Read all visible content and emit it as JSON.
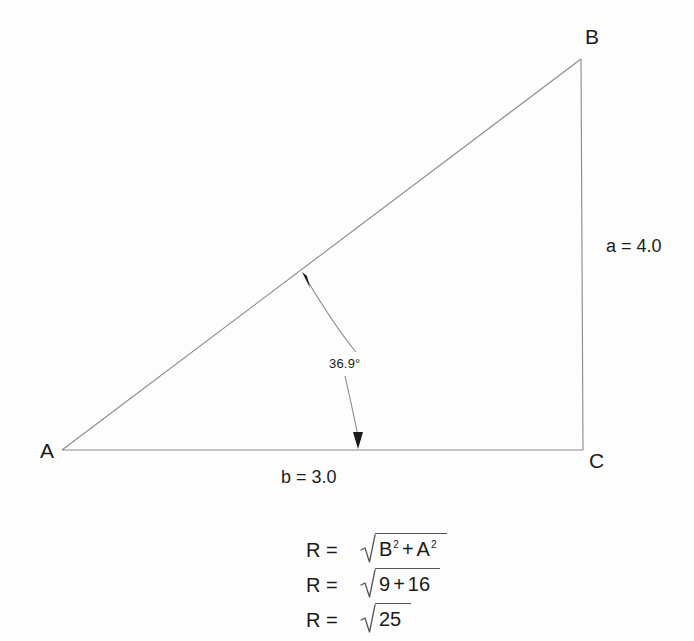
{
  "figure": {
    "type": "right-triangle-diagram",
    "background_color": "#fdfdfd",
    "line_color": "#8a8a8a",
    "text_color": "#1c1c1c",
    "vertices": [
      {
        "name": "A",
        "label": "A",
        "x": 62,
        "y": 450,
        "label_x": 40,
        "label_y": 440
      },
      {
        "name": "B",
        "label": "B",
        "x": 581,
        "y": 59,
        "label_x": 585,
        "label_y": 26
      },
      {
        "name": "C",
        "label": "C",
        "x": 583,
        "y": 450,
        "label_x": 589,
        "label_y": 450
      }
    ],
    "sides": [
      {
        "name": "a",
        "label": "a = 4.0",
        "value": 4.0,
        "from": "B",
        "to": "C",
        "label_x": 606,
        "label_y": 237
      },
      {
        "name": "b",
        "label": "b = 3.0",
        "value": 3.0,
        "from": "A",
        "to": "C",
        "label_x": 281,
        "label_y": 468
      },
      {
        "name": "hypotenuse",
        "label": "",
        "from": "A",
        "to": "B"
      }
    ],
    "angle": {
      "label": "36.9°",
      "value": 36.9,
      "at_vertex": "A",
      "label_x": 329,
      "label_y": 357
    }
  },
  "equations": {
    "rows": [
      {
        "lhs": "R =",
        "radicand_parts": [
          {
            "base": "B",
            "sup": "2"
          },
          {
            "op": "+"
          },
          {
            "base": "A",
            "sup": "2"
          }
        ],
        "plain": "R = √(B² + A²)"
      },
      {
        "lhs": "R =",
        "radicand_parts": [
          {
            "base": "9",
            "sup": ""
          },
          {
            "op": "+"
          },
          {
            "base": "16",
            "sup": ""
          }
        ],
        "plain": "R = √(9 + 16)"
      },
      {
        "lhs": "R =",
        "radicand_parts": [
          {
            "base": "25",
            "sup": ""
          }
        ],
        "plain": "R = √25"
      }
    ]
  }
}
